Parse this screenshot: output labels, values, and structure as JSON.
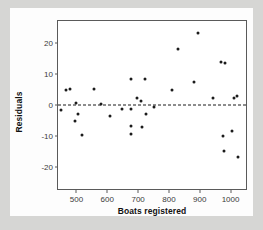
{
  "chart_data": {
    "type": "scatter",
    "title": "",
    "xlabel": "Boats registered",
    "ylabel": "Residuals",
    "xlim": [
      440,
      1050
    ],
    "ylim": [
      -27,
      27
    ],
    "xticks": [
      500,
      600,
      700,
      800,
      900,
      1000
    ],
    "yticks": [
      20,
      10,
      0,
      -10,
      -20
    ],
    "xtick_labels": [
      "500",
      "600",
      "700",
      "800",
      "900",
      "1000"
    ],
    "ytick_labels": [
      "20",
      "10",
      "0",
      "-10",
      "-20"
    ],
    "grid": false,
    "legend": false,
    "reference_line": {
      "type": "horizontal",
      "y": 0,
      "style": "dashed",
      "color": "#1b1b1b"
    },
    "marker_color": "#1b1b1b",
    "points": [
      {
        "x": 449,
        "y": -1.6
      },
      {
        "x": 466,
        "y": 4.7
      },
      {
        "x": 478,
        "y": 5.1
      },
      {
        "x": 494,
        "y": -5.3
      },
      {
        "x": 500,
        "y": 0.8
      },
      {
        "x": 506,
        "y": -3.0
      },
      {
        "x": 519,
        "y": -9.8
      },
      {
        "x": 556,
        "y": 5.0
      },
      {
        "x": 580,
        "y": 0.4
      },
      {
        "x": 610,
        "y": -3.4
      },
      {
        "x": 647,
        "y": -1.3
      },
      {
        "x": 676,
        "y": 8.3
      },
      {
        "x": 676,
        "y": -1.2
      },
      {
        "x": 676,
        "y": -6.7
      },
      {
        "x": 678,
        "y": -9.4
      },
      {
        "x": 697,
        "y": 2.3
      },
      {
        "x": 708,
        "y": 1.4
      },
      {
        "x": 712,
        "y": -7.0
      },
      {
        "x": 722,
        "y": 8.5
      },
      {
        "x": 724,
        "y": -2.9
      },
      {
        "x": 753,
        "y": -0.5
      },
      {
        "x": 809,
        "y": 4.8
      },
      {
        "x": 830,
        "y": 17.9
      },
      {
        "x": 881,
        "y": 7.4
      },
      {
        "x": 894,
        "y": 23.2
      },
      {
        "x": 944,
        "y": 2.2
      },
      {
        "x": 970,
        "y": 13.9
      },
      {
        "x": 975,
        "y": -10.1
      },
      {
        "x": 978,
        "y": -14.8
      },
      {
        "x": 983,
        "y": 13.5
      },
      {
        "x": 1005,
        "y": -8.3
      },
      {
        "x": 1010,
        "y": 2.4
      },
      {
        "x": 1020,
        "y": 2.8
      },
      {
        "x": 1025,
        "y": -16.6
      }
    ]
  },
  "axis": {
    "y_title": "Residuals",
    "x_title": "Boats registered"
  }
}
